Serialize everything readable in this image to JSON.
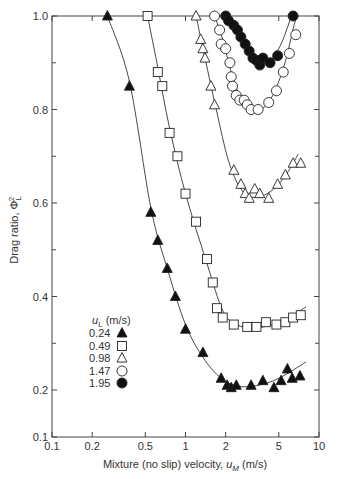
{
  "chart_data": {
    "type": "scatter",
    "title": "",
    "xlabel": "Mixture (no slip) velocity, u_M (m/s)",
    "ylabel": "Drag ratio, Φ_L^2",
    "xscale": "log",
    "xlim": [
      0.1,
      10
    ],
    "ylim": [
      0.1,
      1.0
    ],
    "x_ticks": [
      "0.1",
      "0.2",
      "0.5",
      "1",
      "2",
      "5",
      "10"
    ],
    "y_ticks": [
      "0.1",
      "0.2",
      "0.4",
      "0.6",
      "0.8",
      "1.0"
    ],
    "grid": false,
    "legend": {
      "title": "u_L (m/s)",
      "position": "lower-left",
      "entries": [
        "0.24",
        "0.49",
        "0.98",
        "1.47",
        "1.95"
      ]
    },
    "series": [
      {
        "name": "0.24",
        "marker": "filled-triangle",
        "x": [
          0.26,
          0.38,
          0.55,
          0.62,
          0.73,
          0.84,
          1.0,
          1.35,
          1.85,
          2.05,
          2.2,
          2.4,
          3.1,
          3.8,
          4.6,
          5.2,
          5.8,
          6.3,
          7.2
        ],
        "y": [
          1.0,
          0.85,
          0.58,
          0.52,
          0.46,
          0.4,
          0.33,
          0.28,
          0.225,
          0.21,
          0.205,
          0.21,
          0.21,
          0.22,
          0.205,
          0.22,
          0.245,
          0.225,
          0.23
        ]
      },
      {
        "name": "0.49",
        "marker": "open-square",
        "x": [
          0.52,
          0.62,
          0.67,
          0.76,
          0.87,
          1.0,
          1.2,
          1.45,
          1.6,
          1.72,
          1.9,
          2.3,
          2.9,
          3.4,
          4.0,
          4.8,
          5.6,
          6.4,
          7.3
        ],
        "y": [
          1.0,
          0.88,
          0.85,
          0.75,
          0.7,
          0.62,
          0.56,
          0.48,
          0.43,
          0.375,
          0.355,
          0.34,
          0.335,
          0.335,
          0.345,
          0.34,
          0.345,
          0.355,
          0.36
        ],
        "note": "values approximate; curve passes near all points"
      },
      {
        "name": "0.98",
        "marker": "open-triangle",
        "x": [
          1.2,
          1.3,
          1.35,
          1.4,
          1.55,
          1.65,
          2.3,
          2.6,
          2.8,
          3.0,
          3.3,
          3.6,
          4.2,
          4.9,
          5.6,
          6.4,
          7.3
        ],
        "y": [
          1.0,
          0.95,
          0.93,
          0.91,
          0.85,
          0.81,
          0.67,
          0.64,
          0.62,
          0.61,
          0.63,
          0.62,
          0.61,
          0.64,
          0.66,
          0.685,
          0.685
        ]
      },
      {
        "name": "1.47",
        "marker": "open-circle",
        "x": [
          1.65,
          1.8,
          1.85,
          2.0,
          2.15,
          2.2,
          2.25,
          2.4,
          2.55,
          2.75,
          2.9,
          3.1,
          3.5,
          4.2,
          4.8,
          5.4,
          6.0,
          6.7
        ],
        "y": [
          1.0,
          0.97,
          0.94,
          0.93,
          0.9,
          0.87,
          0.85,
          0.83,
          0.82,
          0.82,
          0.81,
          0.8,
          0.8,
          0.815,
          0.84,
          0.88,
          0.92,
          0.96
        ]
      },
      {
        "name": "1.95",
        "marker": "filled-circle",
        "x": [
          2.0,
          2.1,
          2.3,
          2.45,
          2.6,
          2.8,
          3.0,
          3.2,
          3.4,
          3.6,
          3.8,
          4.3,
          4.9,
          6.4
        ],
        "y": [
          1.0,
          0.99,
          0.98,
          0.97,
          0.955,
          0.94,
          0.925,
          0.91,
          0.905,
          0.895,
          0.91,
          0.9,
          0.915,
          1.0
        ]
      }
    ],
    "fit_curves": true
  },
  "axes": {
    "xlabel_main": "Mixture (no slip) velocity, ",
    "xlabel_sym": "u",
    "xlabel_sub": "M",
    "xlabel_unit": " (m/s)",
    "ylabel_main": "Drag ratio, Φ",
    "ylabel_sub": "L",
    "ylabel_sup": "2"
  },
  "legend": {
    "title_sym": "u",
    "title_sub": "L",
    "title_unit": " (m/s)",
    "entries": [
      "0.24",
      "0.49",
      "0.98",
      "1.47",
      "1.95"
    ]
  },
  "caption_fragment": "Fig. 3.6"
}
